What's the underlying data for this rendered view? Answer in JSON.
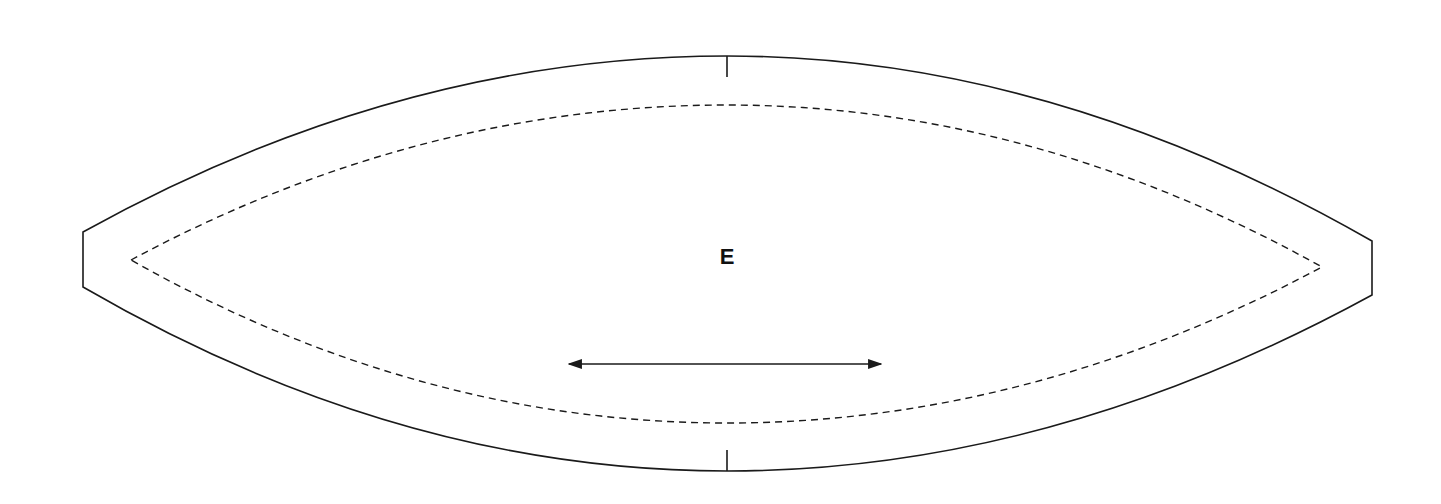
{
  "diagram": {
    "type": "pattern-piece",
    "shape": "elongated lens / almond with flat ends",
    "piece_label": "E",
    "colors": {
      "background": "#ffffff",
      "outline": "#1a1a1a",
      "seam_line": "#1a1a1a",
      "grainline": "#1a1a1a"
    },
    "outline": {
      "left_end": {
        "x": 83,
        "y_top": 232,
        "y_bottom": 287
      },
      "right_end": {
        "x": 1372,
        "y_top": 241,
        "y_bottom": 295
      },
      "top_apex": {
        "x": 727,
        "y": 56
      },
      "bottom_apex": {
        "x": 727,
        "y": 471
      }
    },
    "seam_line": {
      "style": "dashed",
      "left_point": {
        "x": 131,
        "y": 260
      },
      "right_point": {
        "x": 1322,
        "y": 267
      },
      "top_apex_y": 105,
      "bottom_apex_y": 423
    },
    "notches": [
      {
        "name": "top-center-notch",
        "x": 727,
        "y1": 56,
        "y2": 77
      },
      {
        "name": "bottom-center-notch",
        "x": 727,
        "y1": 450,
        "y2": 471
      }
    ],
    "grainline": {
      "x1": 567,
      "x2": 883,
      "y": 364,
      "arrows": "both"
    },
    "label_position": {
      "x": 727,
      "y": 257
    }
  }
}
